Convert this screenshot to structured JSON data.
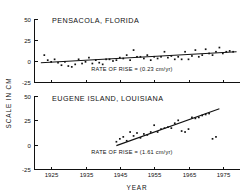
{
  "figure": {
    "ylabel": "SCALE IN CM",
    "xlabel": "YEAR",
    "line_color": "#111111",
    "point_color": "#111111",
    "background": "#ffffff"
  },
  "chart_data": [
    {
      "type": "scatter",
      "title": "PENSACOLA, FLORIDA",
      "xlabel": "",
      "ylabel": "SCALE IN CM",
      "xlim": [
        1920,
        1980
      ],
      "ylim": [
        -25,
        50
      ],
      "xticks": [
        1925,
        1935,
        1945,
        1955,
        1965,
        1975
      ],
      "yticks": [
        -25,
        0,
        25,
        50
      ],
      "grid": false,
      "legend": "none",
      "annotation": "RATE OF RISE = (0.23 cm/yr)",
      "trend": {
        "rate_cm_per_yr": 0.23,
        "x_start": 1922,
        "x_end": 1979,
        "y_start": -2.0,
        "y_end": 11.1
      },
      "x": [
        1923,
        1924,
        1925,
        1926,
        1927,
        1928,
        1929,
        1930,
        1931,
        1932,
        1933,
        1934,
        1935,
        1936,
        1937,
        1938,
        1939,
        1940,
        1941,
        1942,
        1943,
        1944,
        1945,
        1946,
        1947,
        1948,
        1949,
        1950,
        1951,
        1952,
        1953,
        1954,
        1955,
        1956,
        1957,
        1958,
        1959,
        1960,
        1961,
        1962,
        1963,
        1964,
        1965,
        1966,
        1967,
        1968,
        1969,
        1970,
        1971,
        1972,
        1973,
        1974,
        1975,
        1976,
        1977,
        1978
      ],
      "values": [
        7,
        1,
        -1,
        2,
        -2,
        -5,
        -1,
        -6,
        -7,
        -4,
        2,
        -3,
        -1,
        4,
        -3,
        1,
        -2,
        -4,
        2,
        2,
        0,
        1,
        4,
        3,
        7,
        1,
        13,
        5,
        5,
        3,
        7,
        1,
        5,
        3,
        5,
        11,
        4,
        6,
        2,
        5,
        2,
        11,
        2,
        6,
        13,
        5,
        7,
        14,
        9,
        7,
        11,
        16,
        9,
        11,
        12,
        11
      ]
    },
    {
      "type": "scatter",
      "title": "EUGENE ISLAND, LOUISIANA",
      "xlabel": "YEAR",
      "ylabel": "SCALE IN CM",
      "xlim": [
        1920,
        1980
      ],
      "ylim": [
        -25,
        50
      ],
      "xticks": [
        1925,
        1935,
        1945,
        1955,
        1965,
        1975
      ],
      "yticks": [
        -25,
        0,
        25,
        50
      ],
      "grid": false,
      "legend": "none",
      "annotation": "RATE OF RISE = (1.61 cm/yr)",
      "trend": {
        "rate_cm_per_yr": 1.61,
        "x_start": 1944,
        "x_end": 1974,
        "y_start": -1.0,
        "y_end": 37.0
      },
      "x": [
        1944,
        1945,
        1946,
        1947,
        1948,
        1949,
        1950,
        1951,
        1952,
        1953,
        1954,
        1955,
        1956,
        1957,
        1958,
        1959,
        1960,
        1961,
        1962,
        1963,
        1964,
        1965,
        1966,
        1967,
        1968,
        1969,
        1970,
        1971,
        1972,
        1973
      ],
      "values": [
        3,
        6,
        8,
        4,
        13,
        9,
        12,
        7,
        11,
        10,
        13,
        20,
        13,
        16,
        17,
        18,
        17,
        22,
        25,
        14,
        13,
        16,
        28,
        27,
        28,
        30,
        31,
        32,
        6,
        8
      ]
    }
  ]
}
